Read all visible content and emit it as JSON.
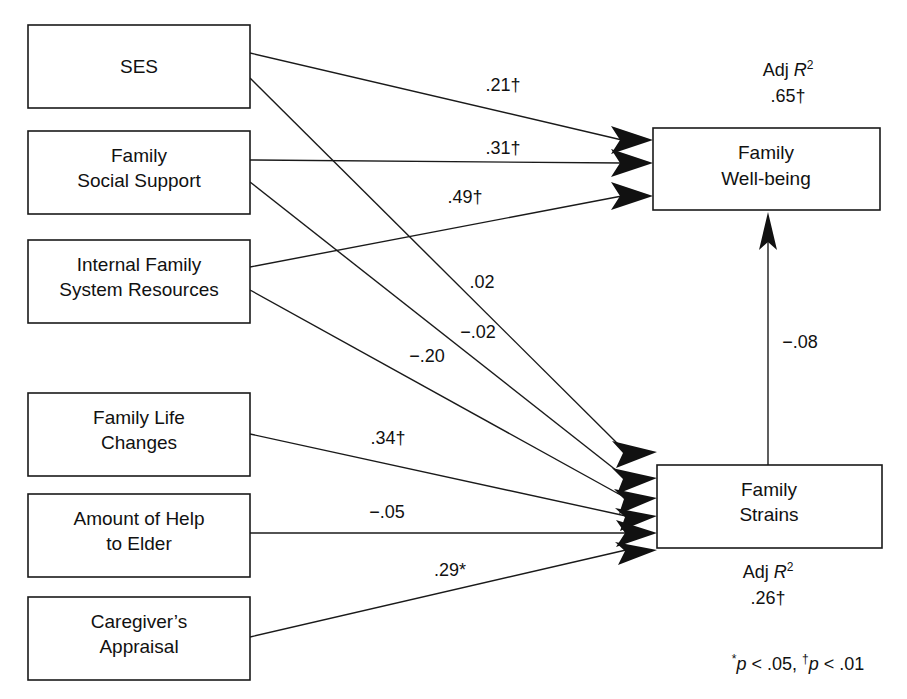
{
  "figure": {
    "type": "path-diagram",
    "title": "",
    "background_color": "#ffffff",
    "line_color": "#1a1a1a",
    "text_color": "#111111"
  },
  "boxes": {
    "ses": {
      "label_line1": "SES",
      "label_line2": ""
    },
    "family_social_support": {
      "label_line1": "Family",
      "label_line2": "Social Support"
    },
    "internal_family_system_resources": {
      "label_line1": "Internal Family",
      "label_line2": "System Resources"
    },
    "family_life_changes": {
      "label_line1": "Family Life",
      "label_line2": "Changes"
    },
    "amount_of_help_to_elder": {
      "label_line1": "Amount of Help",
      "label_line2": "to Elder"
    },
    "caregivers_appraisal": {
      "label_line1": "Caregiver’s",
      "label_line2": "Appraisal"
    },
    "family_well_being": {
      "label_line1": "Family",
      "label_line2": "Well-being"
    },
    "family_strains": {
      "label_line1": "Family",
      "label_line2": "Strains"
    }
  },
  "coefficients": {
    "ses_to_wellbeing": {
      "value": ".21",
      "marker": "†",
      "text": ".21†"
    },
    "social_support_to_wellbeing": {
      "value": ".31",
      "marker": "†",
      "text": ".31†"
    },
    "internal_resources_to_wellbeing": {
      "value": ".49",
      "marker": "†",
      "text": ".49†"
    },
    "ses_to_strains": {
      "value": ".02",
      "marker": "",
      "text": ".02"
    },
    "social_support_to_strains": {
      "value": "−.02",
      "marker": "",
      "text": "−.02"
    },
    "internal_resources_to_strains": {
      "value": "−.20",
      "marker": "",
      "text": "−.20"
    },
    "life_changes_to_strains": {
      "value": ".34",
      "marker": "†",
      "text": ".34†"
    },
    "help_to_elder_to_strains": {
      "value": "−.05",
      "marker": "",
      "text": "−.05"
    },
    "caregivers_appraisal_to_strains": {
      "value": ".29",
      "marker": "*",
      "text": ".29*"
    },
    "strains_to_wellbeing": {
      "value": "−.08",
      "marker": "",
      "text": "−.08"
    }
  },
  "r_squared": {
    "wellbeing": {
      "caption_prefix": "Adj ",
      "caption_symbol": "R",
      "caption_exponent": "2",
      "value": ".65",
      "marker": "†",
      "value_text": ".65†"
    },
    "strains": {
      "caption_prefix": "Adj ",
      "caption_symbol": "R",
      "caption_exponent": "2",
      "value": ".26",
      "marker": "†",
      "value_text": ".26†"
    }
  },
  "footnote": {
    "star_marker": "*",
    "p_symbol": "p",
    "first_part": " < .05, ",
    "dagger_marker": "†",
    "second_part": " < .01",
    "full_text": "*p < .05, †p < .01"
  }
}
